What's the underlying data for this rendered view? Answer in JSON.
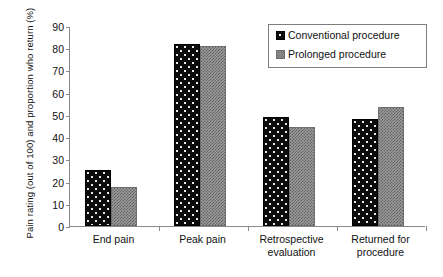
{
  "chart_data": {
    "type": "bar",
    "title": "",
    "subtitle": "",
    "xlabel": "",
    "ylabel": "Pain rating (out of 100) and proportion who return (%)",
    "ylim": [
      0,
      90
    ],
    "ytick_step": 10,
    "yticks": [
      "90",
      "80",
      "70",
      "60",
      "50",
      "40",
      "30",
      "20",
      "10",
      "0"
    ],
    "grid": false,
    "legend_position": "top-right",
    "categories": [
      "End pain",
      "Peak pain",
      "Retrospective evaluation",
      "Returned for procedure"
    ],
    "series": [
      {
        "name": "Conventional procedure",
        "color": "#0c0c0c",
        "pattern": "dotted",
        "values": [
          25,
          82,
          49,
          48
        ]
      },
      {
        "name": "Prolonged procedure",
        "color": "#9b9b9b",
        "pattern": "crosshatch",
        "values": [
          17.5,
          81,
          44.5,
          53.5
        ]
      }
    ]
  },
  "legend": {
    "entries": [
      {
        "label": "Conventional procedure"
      },
      {
        "label": "Prolonged procedure"
      }
    ]
  }
}
